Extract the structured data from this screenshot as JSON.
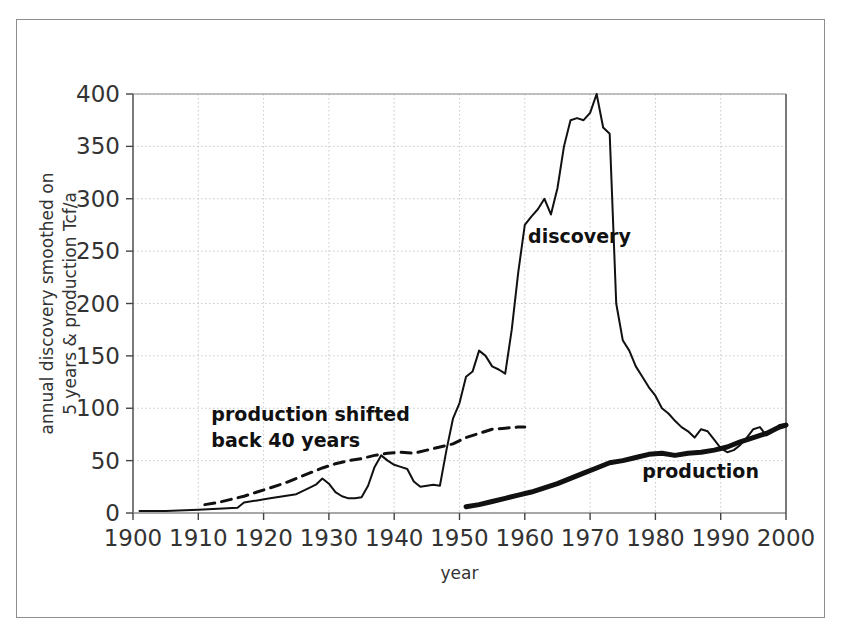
{
  "chart_data": {
    "type": "line",
    "title": "",
    "xlabel": "year",
    "ylabel": "annual discovery smoothed on 5 years & production Tcf/a",
    "ylabel_line1": "annual discovery smoothed on",
    "ylabel_line2": "5 years & production Tcf/a",
    "xlim": [
      1900,
      2000
    ],
    "ylim": [
      0,
      400
    ],
    "xticks": [
      1900,
      1910,
      1920,
      1930,
      1940,
      1950,
      1960,
      1970,
      1980,
      1990,
      2000
    ],
    "xticklabels": [
      "1900",
      "1910",
      "1920",
      "1930",
      "1940",
      "1950",
      "1960",
      "1970",
      "1980",
      "1990",
      "2000"
    ],
    "yticks": [
      0,
      50,
      100,
      150,
      200,
      250,
      300,
      350,
      400
    ],
    "yticklabels": [
      "0",
      "50",
      "100",
      "150",
      "200",
      "250",
      "300",
      "350",
      "400"
    ],
    "grid": true,
    "grid_style": "dotted",
    "grid_color": "#c8c8c8",
    "legend_position": "inline-annotations",
    "annotations": [
      {
        "name": "discovery",
        "text": "discovery",
        "x": 1960.5,
        "y": 258,
        "bold": true
      },
      {
        "name": "production",
        "text": "production",
        "x": 1978.0,
        "y": 33,
        "bold": true
      },
      {
        "name": "production-shifted",
        "text": "production shifted",
        "x": 1912.0,
        "y": 88,
        "bold": true
      },
      {
        "name": "production-shifted-2",
        "text": "back 40 years",
        "x": 1912.0,
        "y": 63,
        "bold": true
      }
    ],
    "series": [
      {
        "name": "discovery",
        "label": "discovery",
        "style": "solid-thin",
        "color": "#111111",
        "linewidth": 2.0,
        "x": [
          1901,
          1905,
          1910,
          1913,
          1916,
          1917,
          1919,
          1921,
          1923,
          1925,
          1927,
          1928,
          1929,
          1930,
          1931,
          1932,
          1933,
          1934,
          1935,
          1936,
          1937,
          1938,
          1939,
          1940,
          1941,
          1942,
          1943,
          1944,
          1945,
          1946,
          1947,
          1948,
          1949,
          1950,
          1951,
          1952,
          1953,
          1954,
          1955,
          1956,
          1957,
          1958,
          1959,
          1960,
          1961,
          1962,
          1963,
          1964,
          1965,
          1966,
          1967,
          1968,
          1969,
          1970,
          1971,
          1972,
          1973,
          1974,
          1975,
          1976,
          1977,
          1978,
          1979,
          1980,
          1981,
          1982,
          1983,
          1984,
          1985,
          1986,
          1987,
          1988,
          1989,
          1990,
          1991,
          1992,
          1993,
          1994,
          1995,
          1996,
          1997,
          1998,
          1999,
          2000
        ],
        "y": [
          2,
          2,
          3,
          4,
          5,
          10,
          12,
          14,
          16,
          18,
          24,
          27,
          33,
          28,
          20,
          16,
          14,
          14,
          15,
          26,
          44,
          55,
          50,
          46,
          44,
          42,
          30,
          25,
          26,
          27,
          26,
          60,
          90,
          105,
          130,
          135,
          155,
          150,
          140,
          137,
          133,
          175,
          230,
          275,
          283,
          290,
          300,
          285,
          310,
          350,
          375,
          377,
          375,
          382,
          400,
          368,
          362,
          200,
          165,
          155,
          140,
          130,
          120,
          112,
          100,
          95,
          88,
          82,
          78,
          72,
          80,
          78,
          70,
          62,
          58,
          60,
          65,
          72,
          80,
          82,
          74,
          78,
          84,
          85
        ]
      },
      {
        "name": "production",
        "label": "production",
        "style": "solid-bold",
        "color": "#111111",
        "linewidth": 5.0,
        "x": [
          1951,
          1953,
          1955,
          1957,
          1959,
          1961,
          1963,
          1965,
          1967,
          1969,
          1971,
          1973,
          1975,
          1977,
          1979,
          1981,
          1983,
          1985,
          1987,
          1989,
          1991,
          1993,
          1995,
          1997,
          1999,
          2000
        ],
        "y": [
          6,
          8,
          11,
          14,
          17,
          20,
          24,
          28,
          33,
          38,
          43,
          48,
          50,
          53,
          56,
          57,
          55,
          57,
          58,
          60,
          63,
          68,
          72,
          76,
          82,
          84
        ]
      },
      {
        "name": "production-shifted-back-40-years",
        "label": "production shifted back 40 years",
        "style": "dashed",
        "color": "#111111",
        "linewidth": 3.0,
        "x": [
          1911,
          1913,
          1915,
          1917,
          1919,
          1921,
          1923,
          1925,
          1927,
          1929,
          1931,
          1933,
          1935,
          1937,
          1939,
          1941,
          1943,
          1945,
          1947,
          1949,
          1951,
          1953,
          1955,
          1957,
          1959,
          1960
        ],
        "y": [
          8,
          10,
          13,
          16,
          20,
          24,
          28,
          33,
          38,
          43,
          47,
          50,
          52,
          55,
          57,
          58,
          57,
          60,
          63,
          66,
          72,
          76,
          80,
          81,
          82,
          82
        ]
      }
    ]
  }
}
